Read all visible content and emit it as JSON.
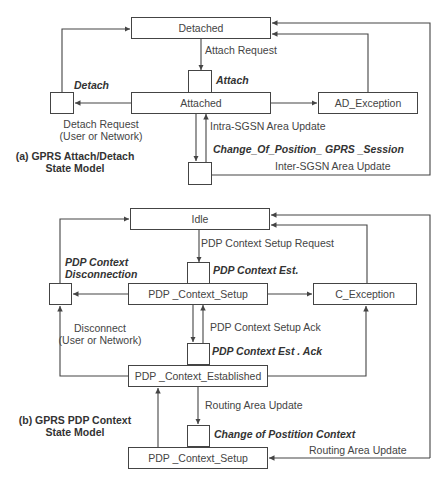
{
  "header": {
    "title_fragment": ""
  },
  "diagram_a": {
    "caption_line1": "(a) GPRS  Attach/Detach",
    "caption_line2": "State Model",
    "states": {
      "detached": "Detached",
      "attached": "Attached",
      "ad_exception": "AD_Exception"
    },
    "transitions": {
      "attach_request": "Attach Request",
      "attach": "Attach",
      "detach": "Detach",
      "detach_request_line1": "Detach Request",
      "detach_request_line2": "(User or Network)",
      "intra_sgsn": "Intra-SGSN  Area Update",
      "change_of_position": "Change_Of_Position_   GPRS _Session",
      "inter_sgsn": "Inter-SGSN  Area Update"
    }
  },
  "diagram_b": {
    "caption_line1": "(b) GPRS  PDP  Context",
    "caption_line2": "State Model",
    "states": {
      "idle": "Idle",
      "pdp_context_setup": "PDP _Context_Setup",
      "c_exception": "C_Exception",
      "pdp_context_established": "PDP _Context_Established",
      "pdp_context_setup_bottom": "PDP _Context_Setup"
    },
    "transitions": {
      "setup_request": "PDP  Context Setup  Request",
      "context_est": "PDP  Context  Est.",
      "disconnection_line1": "PDP  Context",
      "disconnection_line2": "Disconnection",
      "disconnect_line1": "Disconnect",
      "disconnect_line2": "(User or Network)",
      "setup_ack": "PDP  Context Setup   Ack",
      "context_est_ack": "PDP  Context  Est . Ack",
      "routing_area_update": "Routing Area Update",
      "change_of_position_context": "Change of  Postition  Context",
      "routing_area_update_right": "Routing Area Update"
    }
  },
  "colors": {
    "line": "#444444",
    "text": "#444444",
    "background": "#ffffff"
  }
}
